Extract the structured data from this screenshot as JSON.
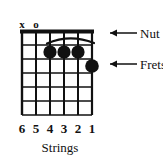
{
  "diagram": {
    "background_color": "#ffffff",
    "ink_color": "#111111",
    "nut": {
      "label": "Nut",
      "arrow_glyph": "←",
      "thickness_px": 4
    },
    "frets": {
      "label": "Frets",
      "arrow_glyph": "←",
      "count": 5,
      "line_y": [
        45,
        59,
        73,
        87,
        101,
        115
      ]
    },
    "strings": {
      "axis_label": "Strings",
      "count": 6,
      "numbers": [
        "6",
        "5",
        "4",
        "3",
        "2",
        "1"
      ],
      "line_x": [
        22,
        36,
        50,
        64,
        78,
        92
      ]
    },
    "open_mute_markers": [
      {
        "symbol": "x",
        "string": 6,
        "meaning": "muted"
      },
      {
        "symbol": "o",
        "string": 5,
        "meaning": "open"
      }
    ],
    "barre": {
      "present": true,
      "fret": 1,
      "from_string": 5,
      "to_string": 1,
      "shape": "arc"
    },
    "finger_dots": [
      {
        "string": 4,
        "fret": 2,
        "cx": 50,
        "cy": 52
      },
      {
        "string": 3,
        "fret": 2,
        "cx": 64,
        "cy": 52
      },
      {
        "string": 2,
        "fret": 2,
        "cx": 78,
        "cy": 52
      },
      {
        "string": 1,
        "fret": 3,
        "cx": 92,
        "cy": 66
      }
    ],
    "grid": {
      "left_x": 22,
      "right_x": 92,
      "top_y": 31,
      "bottom_y": 115
    },
    "callouts": [
      {
        "id": "nut",
        "label": "Nut",
        "arrow_glyph": "←",
        "target_y": 31
      },
      {
        "id": "frets",
        "label": "Frets",
        "arrow_glyph": "←",
        "target_y": 66
      }
    ]
  }
}
